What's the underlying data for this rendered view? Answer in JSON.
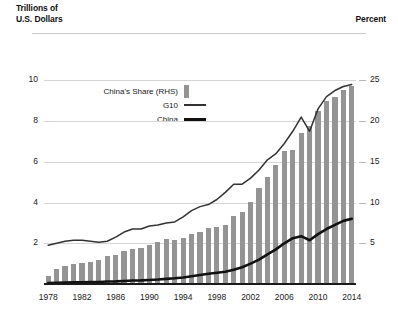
{
  "labels": {
    "lhs_title": "Trillions of\nU.S. Dollars",
    "rhs_title": "Percent"
  },
  "legend": {
    "items": [
      {
        "label": "China's Share (RHS)",
        "key": "bar-swatch",
        "color": "#949494"
      },
      {
        "label": "G10",
        "key": "line-swatch-thin",
        "color": "#333333"
      },
      {
        "label": "China",
        "key": "line-swatch-thick",
        "color": "#111111"
      }
    ]
  },
  "chart_data": {
    "type": "bar",
    "title": "",
    "xlabel": "",
    "ylabel": "Trillions of U.S. Dollars",
    "y2label": "Percent",
    "grid": true,
    "legend_position": "inside-upper-left",
    "x": [
      1978,
      1979,
      1980,
      1981,
      1982,
      1983,
      1984,
      1985,
      1986,
      1987,
      1988,
      1989,
      1990,
      1991,
      1992,
      1993,
      1994,
      1995,
      1996,
      1997,
      1998,
      1999,
      2000,
      2001,
      2002,
      2003,
      2004,
      2005,
      2006,
      2007,
      2008,
      2009,
      2010,
      2011,
      2012,
      2013,
      2014
    ],
    "xticks": [
      1978,
      1982,
      1986,
      1990,
      1994,
      1998,
      2002,
      2006,
      2010,
      2014
    ],
    "ylim": [
      0,
      11
    ],
    "yticks": [
      2,
      4,
      6,
      8,
      10
    ],
    "y2lim": [
      0,
      27.5
    ],
    "y2ticks": [
      5,
      10,
      15,
      20,
      25
    ],
    "series": [
      {
        "name": "China's Share (RHS)",
        "type": "bar",
        "axis": "right",
        "unit": "percent",
        "color": "#949494",
        "values": [
          1.0,
          1.8,
          2.2,
          2.5,
          2.6,
          2.7,
          3.0,
          3.4,
          3.6,
          4.0,
          4.3,
          4.4,
          4.8,
          5.2,
          5.5,
          5.4,
          5.7,
          6.1,
          6.4,
          6.9,
          7.0,
          7.3,
          8.3,
          8.8,
          10.1,
          11.8,
          13.1,
          14.6,
          16.3,
          16.4,
          18.6,
          19.4,
          21.2,
          22.5,
          23.0,
          23.8,
          24.3
        ]
      },
      {
        "name": "G10",
        "type": "line",
        "axis": "left",
        "unit": "trillions",
        "color": "#333333",
        "values": [
          1.9,
          2.0,
          2.1,
          2.15,
          2.15,
          2.1,
          2.05,
          2.1,
          2.3,
          2.55,
          2.7,
          2.7,
          2.85,
          2.9,
          3.0,
          3.05,
          3.3,
          3.6,
          3.8,
          3.9,
          4.15,
          4.5,
          4.9,
          4.9,
          5.2,
          5.6,
          6.1,
          6.4,
          6.9,
          7.5,
          8.2,
          7.5,
          8.6,
          9.2,
          9.5,
          9.7,
          9.8
        ]
      },
      {
        "name": "China",
        "type": "line",
        "axis": "left",
        "unit": "trillions",
        "color": "#111111",
        "values": [
          0.05,
          0.06,
          0.07,
          0.08,
          0.08,
          0.09,
          0.1,
          0.12,
          0.13,
          0.15,
          0.17,
          0.18,
          0.2,
          0.22,
          0.25,
          0.28,
          0.32,
          0.38,
          0.44,
          0.5,
          0.55,
          0.6,
          0.7,
          0.82,
          1.0,
          1.2,
          1.45,
          1.7,
          2.0,
          2.25,
          2.35,
          2.15,
          2.45,
          2.7,
          2.9,
          3.1,
          3.2
        ]
      }
    ]
  }
}
